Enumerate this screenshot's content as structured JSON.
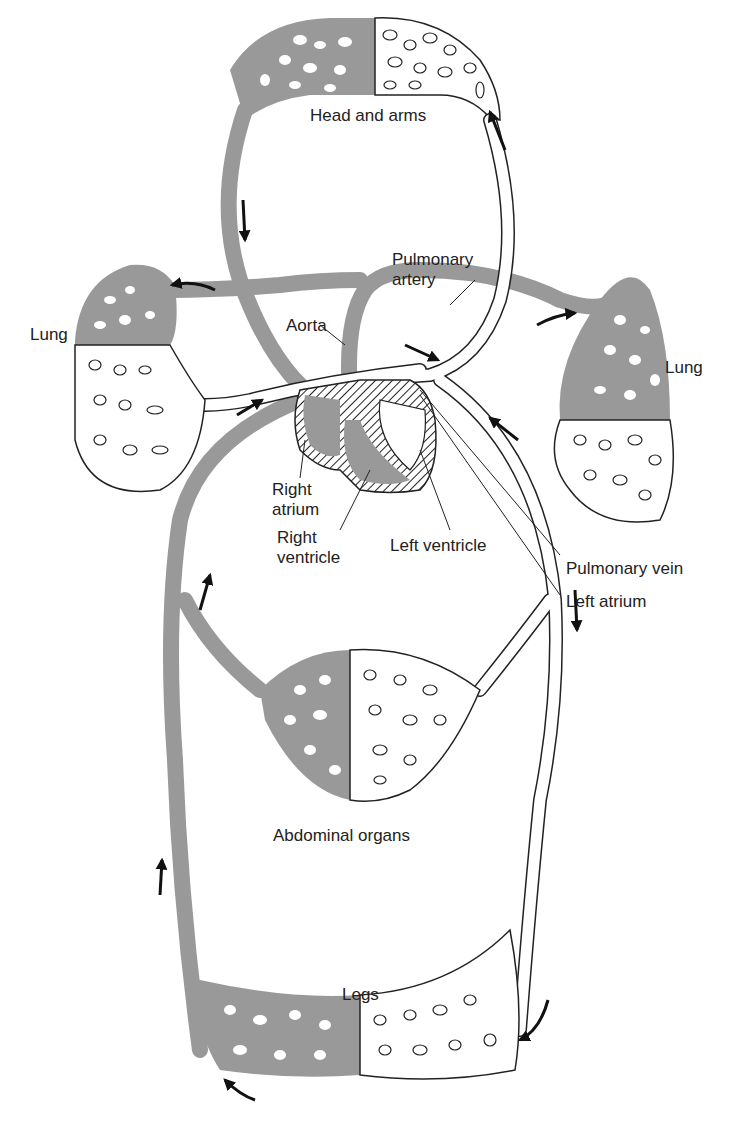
{
  "diagram": {
    "type": "circulatory-system-schematic",
    "colors": {
      "deoxygenated": "#999999",
      "oxygenated": "#ffffff",
      "outline": "#222222",
      "background": "#ffffff"
    },
    "labels": {
      "head_and_arms": "Head and arms",
      "pulmonary_artery": "Pulmonary\nartery",
      "lung_left": "Lung",
      "lung_right": "Lung",
      "aorta": "Aorta",
      "right_atrium": "Right\natrium",
      "right_ventricle": "Right\nventricle",
      "left_ventricle": "Left ventricle",
      "pulmonary_vein": "Pulmonary vein",
      "left_atrium": "Left atrium",
      "abdominal_organs": "Abdominal organs",
      "legs": "Legs"
    }
  }
}
